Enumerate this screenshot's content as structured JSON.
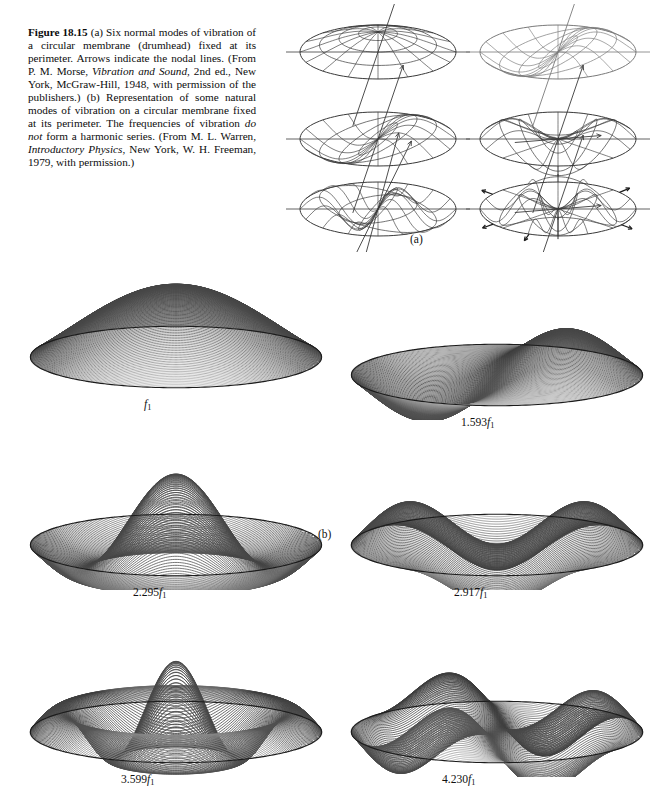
{
  "figure": {
    "number": "Figure 18.15",
    "caption_segments": [
      {
        "text": "Figure 18.15",
        "style": "bold"
      },
      {
        "text": "   (a) Six normal modes of vibration of a circular membrane (drumhead) fixed at its perimeter. Arrows indicate the nodal lines. (From P. M. Morse, ",
        "style": "normal"
      },
      {
        "text": "Vibration and Sound",
        "style": "italic"
      },
      {
        "text": ", 2nd ed., New York, McGraw-Hill, 1948, with permission of the publishers.) (b) Representation of some natural modes of vibration on a circular membrane fixed at its perimeter. The frequencies of vibration ",
        "style": "normal"
      },
      {
        "text": "do not",
        "style": "italic"
      },
      {
        "text": " form a harmonic series. (From M. L. Warren, ",
        "style": "normal"
      },
      {
        "text": "Introductory Physics",
        "style": "italic"
      },
      {
        "text": ", New York, W. H. Freeman, 1979, with permission.)",
        "style": "normal"
      }
    ],
    "caption_plain": "Figure 18.15   (a) Six normal modes of vibration of a circular membrane (drumhead) fixed at its perimeter. Arrows indicate the nodal lines. (From P. M. Morse, Vibration and Sound, 2nd ed., New York, McGraw-Hill, 1948, with permission of the publishers.) (b) Representation of some natural modes of vibration on a circular membrane fixed at its perimeter. The frequencies of vibration do not form a harmonic series. (From M. L. Warren, Introductory Physics, New York, W. H. Freeman, 1979, with permission.)"
  },
  "part_a": {
    "panel_label": "(a)",
    "description": "Six normal modes of vibration of a circular membrane drawn as polar wireframe meshes, each with straight lines and arrows marking the nodal lines.",
    "diagrams": [
      {
        "id": "wire-mode-1",
        "row": 0,
        "col": 0,
        "nodal_diameters": 0,
        "nodal_circles": 0,
        "nodal_line_style": "single-diagonal-axis",
        "arrows": 1
      },
      {
        "id": "wire-mode-2",
        "row": 0,
        "col": 1,
        "nodal_diameters": 1,
        "nodal_circles": 0,
        "nodal_line_style": "single-diagonal-axis",
        "arrows": 0
      },
      {
        "id": "wire-mode-3",
        "row": 1,
        "col": 0,
        "nodal_diameters": 1,
        "nodal_circles": 0,
        "nodal_line_style": "single-diagonal-axis",
        "arrows": 2
      },
      {
        "id": "wire-mode-4",
        "row": 1,
        "col": 1,
        "nodal_diameters": 2,
        "nodal_circles": 0,
        "nodal_line_style": "crossed-axes",
        "arrows": 1
      },
      {
        "id": "wire-mode-5",
        "row": 2,
        "col": 0,
        "nodal_diameters": 1,
        "nodal_circles": 1,
        "nodal_line_style": "double-diagonal-axis",
        "arrows": 2
      },
      {
        "id": "wire-mode-6",
        "row": 2,
        "col": 1,
        "nodal_diameters": 2,
        "nodal_circles": 1,
        "nodal_line_style": "crossed-axes",
        "arrows": 5
      }
    ]
  },
  "part_b": {
    "panel_label": "(b)",
    "modes": [
      {
        "id": "mode-f1",
        "label_prefix": "",
        "label_symbol": "f",
        "label_subscript": "1",
        "label_full": "f₁",
        "multiplier": 1.0,
        "nodal_diameters": 0,
        "nodal_circles": 0,
        "shape": "dome",
        "amplitude": 1.0
      },
      {
        "id": "mode-1593f1",
        "label_prefix": "1.593",
        "label_symbol": "f",
        "label_subscript": "1",
        "label_full": "1.593f₁",
        "multiplier": 1.593,
        "nodal_diameters": 1,
        "nodal_circles": 0,
        "shape": "one-diametric-node",
        "amplitude": 0.62
      },
      {
        "id": "mode-2295f1",
        "label_prefix": "2.295",
        "label_symbol": "f",
        "label_subscript": "1",
        "label_full": "2.295f₁",
        "multiplier": 2.295,
        "nodal_diameters": 0,
        "nodal_circles": 1,
        "shape": "central-peak-with-ring",
        "amplitude": 1.0
      },
      {
        "id": "mode-2917f1",
        "label_prefix": "2.917",
        "label_symbol": "f",
        "label_subscript": "1",
        "label_full": "2.917f₁",
        "multiplier": 2.917,
        "nodal_diameters": 2,
        "nodal_circles": 0,
        "shape": "two-diametric-nodes",
        "amplitude": 0.6
      },
      {
        "id": "mode-3599f1",
        "label_prefix": "3.599",
        "label_symbol": "f",
        "label_subscript": "1",
        "label_full": "3.599f₁",
        "multiplier": 3.599,
        "nodal_diameters": 0,
        "nodal_circles": 2,
        "shape": "tall-central-spike-with-rings",
        "amplitude": 1.0
      },
      {
        "id": "mode-4230f1",
        "label_prefix": "4.230",
        "label_symbol": "f",
        "label_subscript": "1",
        "label_full": "4.230f₁",
        "multiplier": 4.23,
        "nodal_diameters": 3,
        "nodal_circles": 0,
        "shape": "three-diametric-nodes",
        "amplitude": 0.58
      }
    ]
  },
  "colors": {
    "background": "#ffffff",
    "ink": "#111111",
    "wireframe": "#3a3a3a",
    "surface_light": "#8d8d8d",
    "surface_dark": "#111111"
  }
}
